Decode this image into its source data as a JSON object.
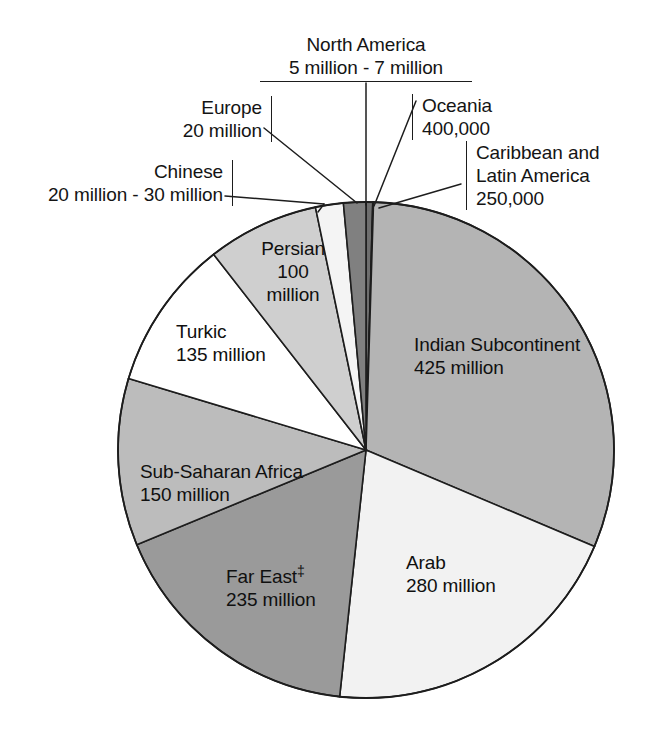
{
  "figure": {
    "type": "pie-chart",
    "background_color": "#ffffff",
    "outline_color": "#1d1d1d"
  },
  "chart_data": {
    "type": "pie",
    "title": "",
    "subtitle": "",
    "xlabel": "",
    "ylabel": "",
    "legend_position": "none",
    "grid": false,
    "units": "people",
    "center": {
      "x": 366,
      "y": 450
    },
    "radius": 248,
    "note_marker": "‡",
    "total_label": "",
    "categories": [
      "North America",
      "Oceania",
      "Caribbean and Latin America",
      "Indian Subcontinent",
      "Arab",
      "Far East",
      "Sub-Saharan Africa",
      "Turkic",
      "Persian",
      "Chinese",
      "Europe"
    ],
    "values": [
      6,
      0.4,
      0.25,
      425,
      280,
      235,
      150,
      135,
      100,
      25,
      20
    ],
    "value_labels": [
      "5 million - 7 million",
      "400,000",
      "250,000",
      "425 million",
      "280 million",
      "235 million",
      "150 million",
      "135 million",
      "100 million",
      "20 million - 30 million",
      "20 million"
    ],
    "slice_colors": [
      "#6e6e6e",
      "#d4d4d4",
      "#9c9c9c",
      "#b4b4b4",
      "#f2f2f2",
      "#9a9a9a",
      "#bcbcbc",
      "#ffffff",
      "#cfcfcf",
      "#f4f4f4",
      "#808080"
    ]
  },
  "callouts": [
    {
      "id": "north-america",
      "name": "North America",
      "lines": [
        "North America",
        "5 million - 7 million"
      ],
      "side": "top-center"
    },
    {
      "id": "oceania",
      "name": "Oceania",
      "lines": [
        "Oceania",
        "400,000"
      ],
      "side": "right"
    },
    {
      "id": "caribbean-latin-america",
      "name": "Caribbean and Latin America",
      "lines": [
        "Caribbean and",
        "Latin America",
        "250,000"
      ],
      "side": "right"
    },
    {
      "id": "europe",
      "name": "Europe",
      "lines": [
        "Europe",
        "20 million"
      ],
      "side": "left"
    },
    {
      "id": "chinese",
      "name": "Chinese",
      "lines": [
        "Chinese",
        "20 million - 30 million"
      ],
      "side": "left"
    }
  ],
  "slice_labels": [
    {
      "id": "indian-subcontinent",
      "name": "Indian Subcontinent",
      "lines": [
        "Indian Subcontinent",
        "425 million"
      ],
      "align": "left"
    },
    {
      "id": "arab",
      "name": "Arab",
      "lines": [
        "Arab",
        "280 million"
      ],
      "align": "left"
    },
    {
      "id": "far-east",
      "name": "Far East",
      "lines": [
        "Far East",
        "235 million"
      ],
      "align": "left",
      "marker": "‡"
    },
    {
      "id": "sub-saharan-africa",
      "name": "Sub-Saharan Africa",
      "lines": [
        "Sub-Saharan Africa",
        "150 million"
      ],
      "align": "left"
    },
    {
      "id": "turkic",
      "name": "Turkic",
      "lines": [
        "Turkic",
        "135 million"
      ],
      "align": "left"
    },
    {
      "id": "persian",
      "name": "Persian",
      "lines": [
        "Persian",
        "100",
        "million"
      ],
      "align": "center"
    }
  ]
}
